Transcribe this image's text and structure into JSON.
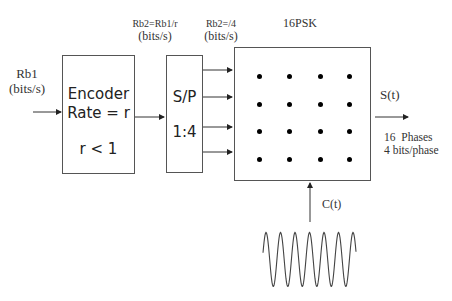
{
  "input": {
    "rate_label": "Rb1",
    "unit": "(bits/s)"
  },
  "encoder": {
    "line1": "Encoder",
    "line2": "Rate = r",
    "line3": "r < 1"
  },
  "encoder_output": {
    "rate_label": "Rb2=Rb1/r",
    "unit": "(bits/s)"
  },
  "sp": {
    "line1": "S/P",
    "line2": "1:4"
  },
  "sp_output": {
    "rate_label": "Rb2=/4",
    "unit": "(bits/s)"
  },
  "modulator": {
    "title": "16PSK",
    "constellation": {
      "rows": 4,
      "cols": 4
    }
  },
  "output": {
    "signal_label": "S(t)",
    "line1": "16  Phases",
    "line2": "4 bits/phase"
  },
  "carrier": {
    "label": "C(t)",
    "cycles": 6
  }
}
